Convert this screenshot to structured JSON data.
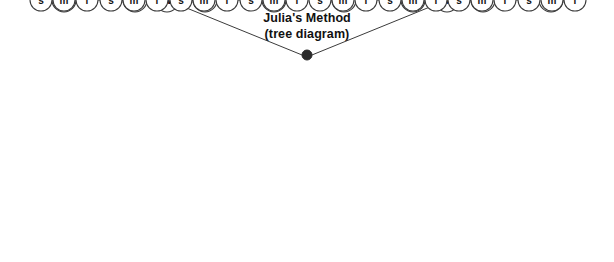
{
  "diagram": {
    "title_line1": "Julia's Method",
    "title_line2": "(tree diagram)",
    "type": "tree-diagram",
    "background_color": "#ffffff",
    "edge_color": "#3b3b3b",
    "node_fill_color": "#ffffff",
    "node_stroke_color": "#3b3b3b",
    "label_color": "#111111",
    "root": {
      "label": "",
      "shape": "filled-dot",
      "color": "#2b2b2b",
      "x": 307,
      "y": 55,
      "radius": 5
    },
    "levels": [
      {
        "name": "level-2",
        "y": 100,
        "radius": 12,
        "nodes": [
          {
            "label": "W",
            "x": 167
          },
          {
            "label": "M",
            "x": 447
          }
        ]
      },
      {
        "name": "level-3",
        "y": 162,
        "radius": 12,
        "nodes": [
          {
            "label": "p",
            "x": 64,
            "parent": "W"
          },
          {
            "label": "t",
            "x": 135,
            "parent": "W"
          },
          {
            "label": "y",
            "x": 205,
            "parent": "W"
          },
          {
            "label": "b",
            "x": 274,
            "parent": "W"
          },
          {
            "label": "p",
            "x": 344,
            "parent": "M"
          },
          {
            "label": "t",
            "x": 413,
            "parent": "M"
          },
          {
            "label": "y",
            "x": 483,
            "parent": "M"
          },
          {
            "label": "b",
            "x": 551,
            "parent": "M"
          }
        ]
      },
      {
        "name": "leaves",
        "y": 239,
        "radius": 11,
        "nodes": [
          {
            "label": "s",
            "x": 41,
            "parent_index": 0
          },
          {
            "label": "m",
            "x": 64,
            "parent_index": 0
          },
          {
            "label": "l",
            "x": 87,
            "parent_index": 0
          },
          {
            "label": "s",
            "x": 111,
            "parent_index": 1
          },
          {
            "label": "m",
            "x": 134,
            "parent_index": 1
          },
          {
            "label": "l",
            "x": 157,
            "parent_index": 1
          },
          {
            "label": "s",
            "x": 181,
            "parent_index": 2
          },
          {
            "label": "m",
            "x": 204,
            "parent_index": 2
          },
          {
            "label": "l",
            "x": 227,
            "parent_index": 2
          },
          {
            "label": "s",
            "x": 251,
            "parent_index": 3
          },
          {
            "label": "m",
            "x": 274,
            "parent_index": 3
          },
          {
            "label": "l",
            "x": 297,
            "parent_index": 3
          },
          {
            "label": "s",
            "x": 320,
            "parent_index": 4
          },
          {
            "label": "m",
            "x": 343,
            "parent_index": 4
          },
          {
            "label": "l",
            "x": 366,
            "parent_index": 4
          },
          {
            "label": "s",
            "x": 390,
            "parent_index": 5
          },
          {
            "label": "m",
            "x": 413,
            "parent_index": 5
          },
          {
            "label": "l",
            "x": 436,
            "parent_index": 5
          },
          {
            "label": "s",
            "x": 459,
            "parent_index": 6
          },
          {
            "label": "m",
            "x": 482,
            "parent_index": 6
          },
          {
            "label": "l",
            "x": 505,
            "parent_index": 6
          },
          {
            "label": "s",
            "x": 529,
            "parent_index": 7
          },
          {
            "label": "m",
            "x": 552,
            "parent_index": 7
          },
          {
            "label": "l",
            "x": 575,
            "parent_index": 7
          }
        ]
      }
    ]
  }
}
